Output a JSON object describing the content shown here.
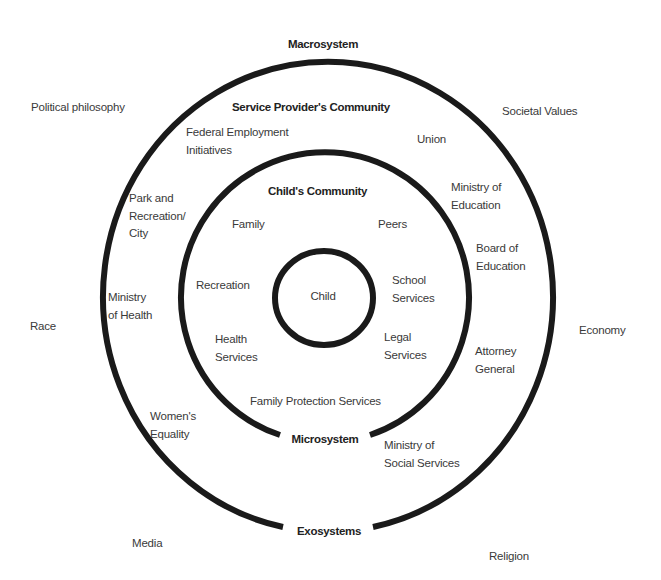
{
  "diagram": {
    "type": "concentric-circles",
    "colors": {
      "ring": "#1a1a1a",
      "text": "#3a3a3a",
      "bold_text": "#222222",
      "background": "#ffffff"
    },
    "system_labels": {
      "macrosystem": "Macrosystem",
      "exosystems": "Exosystems",
      "microsystem": "Microsystem"
    },
    "outside": {
      "political_philosophy": "Political philosophy",
      "societal_values": "Societal Values",
      "race": "Race",
      "economy": "Economy",
      "media": "Media",
      "religion": "Religion"
    },
    "service_providers_ring": {
      "title": "Service Provider's Community",
      "federal_employment": [
        "Federal Employment",
        "Initiatives"
      ],
      "union": "Union",
      "park_and_recreation": [
        "Park and",
        "Recreation/",
        "City"
      ],
      "ministry_of_education": [
        "Ministry of",
        "Education"
      ],
      "board_of_education": [
        "Board of",
        "Education"
      ],
      "ministry_of_health": [
        "Ministry",
        "of Health"
      ],
      "attorney_general": [
        "Attorney",
        "General"
      ],
      "womens_equality": [
        "Women's",
        "Equality"
      ],
      "ministry_of_social_services": [
        "Ministry of",
        "Social Services"
      ]
    },
    "childs_community_ring": {
      "title": "Child's Community",
      "family": "Family",
      "peers": "Peers",
      "recreation": "Recreation",
      "school_services": [
        "School",
        "Services"
      ],
      "health_services": [
        "Health",
        "Services"
      ],
      "legal_services": [
        "Legal",
        "Services"
      ],
      "family_protection_services": "Family Protection Services"
    },
    "center": {
      "child": "Child"
    }
  }
}
